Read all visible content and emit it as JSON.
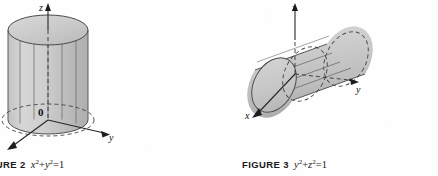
{
  "page": {
    "background_color": "#fefefe",
    "width": 438,
    "height": 176
  },
  "figures": [
    {
      "id": "figure-2",
      "caption_label": "GURE 2",
      "caption_label_full": "FIGURE 2",
      "caption_equation_parts": {
        "var1": "x",
        "exp1": "2",
        "operator": "+",
        "var2": "y",
        "exp2": "2",
        "equals": "=",
        "value": "1"
      },
      "caption_equation_text": "x2 + y2 = 1",
      "surface_type": "circular cylinder, axis along z",
      "axes": [
        {
          "name": "z-axis",
          "label": "z",
          "direction": "up"
        },
        {
          "name": "y-axis",
          "label": "y",
          "direction": "right"
        },
        {
          "name": "x-axis",
          "label": "",
          "direction": "down-left"
        }
      ],
      "origin_label": "0"
    },
    {
      "id": "figure-3",
      "caption_label": "FIGURE 3",
      "caption_label_full": "FIGURE 3",
      "caption_equation_parts": {
        "var1": "y",
        "exp1": "2",
        "operator": "+",
        "var2": "z",
        "exp2": "2",
        "equals": "=",
        "value": "1"
      },
      "caption_equation_text": "y2 + z2 = 1",
      "surface_type": "circular cylinder, axis along x",
      "axes": [
        {
          "name": "z-axis",
          "label": "z",
          "direction": "up"
        },
        {
          "name": "y-axis",
          "label": "y",
          "direction": "right"
        },
        {
          "name": "x-axis",
          "label": "x",
          "direction": "down-left"
        }
      ],
      "origin_label": ""
    }
  ],
  "colors": {
    "ink": "#1a1a1a",
    "axis_line": "#2b2b2b",
    "surface_light": "#d2d2d2",
    "surface_mid": "#bdbdbd",
    "surface_dark": "#a8a8a8",
    "surface_edge": "#555555",
    "hidden_dash": "#4a4a4a",
    "paper": "#fefefe"
  }
}
